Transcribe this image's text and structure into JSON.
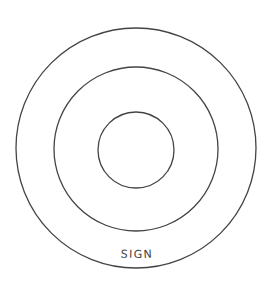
{
  "diagram": {
    "type": "concentric-circles",
    "center": [
      136,
      149
    ],
    "stroke_color": "#444444",
    "background": "#ffffff",
    "circles": [
      {
        "name": "outer",
        "radius": 120
      },
      {
        "name": "middle",
        "radius": 82
      },
      {
        "name": "inner",
        "radius": 38
      }
    ],
    "label": {
      "text": "SIGN",
      "position": "bottom, between middle and outer ring"
    }
  }
}
